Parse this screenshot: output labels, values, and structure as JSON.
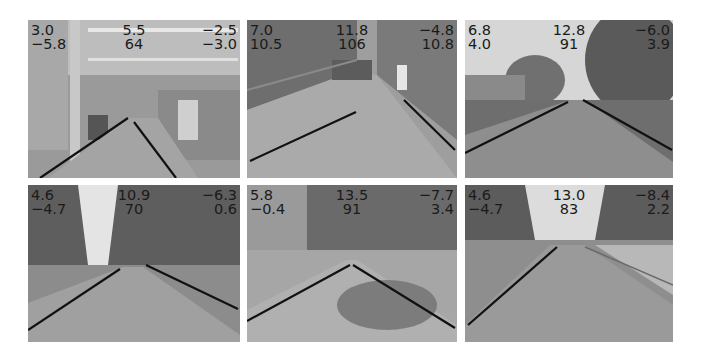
{
  "figure": {
    "panels": [
      {
        "id": "indoor-hallway-lab",
        "scene": "indoor",
        "labels": {
          "top_left": "3.0",
          "top_center": "5.5",
          "top_right": "−2.5",
          "bottom_left": "−5.8",
          "bottom_center": "64",
          "bottom_right": "−3.0"
        }
      },
      {
        "id": "indoor-corridor",
        "scene": "corridor",
        "labels": {
          "top_left": "7.0",
          "top_center": "11.8",
          "top_right": "−4.8",
          "bottom_left": "10.5",
          "bottom_center": "106",
          "bottom_right": "10.8"
        }
      },
      {
        "id": "outdoor-campus-path",
        "scene": "outdoor-trees",
        "labels": {
          "top_left": "6.8",
          "top_center": "12.8",
          "top_right": "−6.0",
          "bottom_left": "4.0",
          "bottom_center": "91",
          "bottom_right": "3.9"
        }
      },
      {
        "id": "outdoor-road-forest",
        "scene": "outdoor-forest",
        "labels": {
          "top_left": "4.6",
          "top_center": "10.9",
          "top_right": "−6.3",
          "bottom_left": "−4.7",
          "bottom_center": "70",
          "bottom_right": "0.6"
        }
      },
      {
        "id": "outdoor-road-shadows",
        "scene": "outdoor-shadow",
        "labels": {
          "top_left": "5.8",
          "top_center": "13.5",
          "top_right": "−7.7",
          "bottom_left": "−0.4",
          "bottom_center": "91",
          "bottom_right": "3.4"
        }
      },
      {
        "id": "outdoor-road-curve",
        "scene": "outdoor-curve",
        "labels": {
          "top_left": "4.6",
          "top_center": "13.0",
          "top_right": "−8.4",
          "bottom_left": "−4.7",
          "bottom_center": "83",
          "bottom_right": "2.2"
        }
      }
    ]
  }
}
